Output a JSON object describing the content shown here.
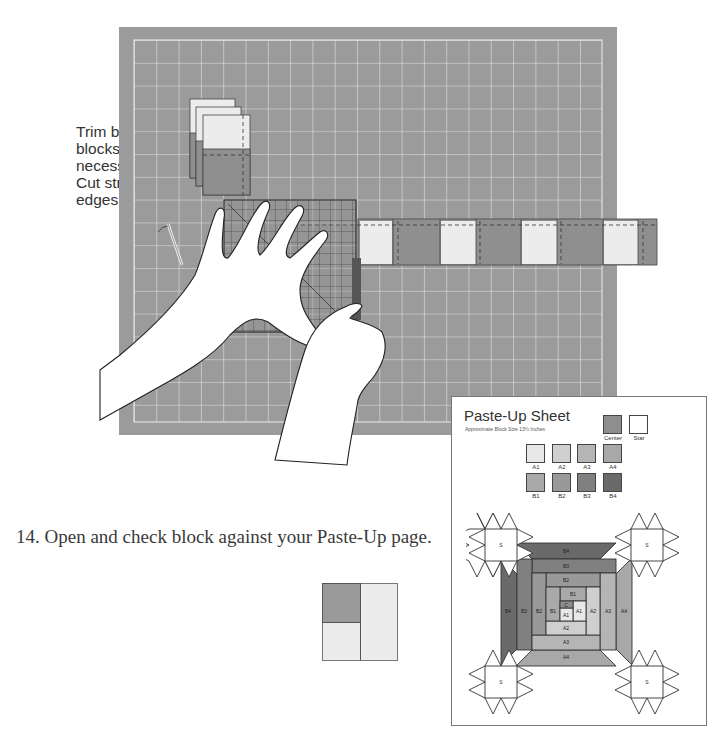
{
  "side_note": {
    "lines": [
      "Trim between",
      "blocks if",
      "necessary.",
      "Cut straight",
      "edges."
    ]
  },
  "step": {
    "text": "14. Open and check block against your Paste-Up page."
  },
  "illustration": {
    "description": "cutting-mat-with-ruler-and-hands",
    "mat_color": "#9b9b9b",
    "grid_color": "#e6e6e6",
    "light_fabric": "#e9e9e9",
    "dark_fabric": "#8f8f8f"
  },
  "block_preview": {
    "colors": {
      "dark": "#9a9a9a",
      "light": "#ececec"
    }
  },
  "paste_up_sheet": {
    "title": "Paste-Up Sheet",
    "subtitle": "Approximate Block Size 13½ Inches",
    "swatches": [
      {
        "label": "Center",
        "color": "#8e8e8e"
      },
      {
        "label": "Star",
        "color": "#ffffff"
      },
      {
        "label": "A1",
        "color": "#e8e8e8"
      },
      {
        "label": "A2",
        "color": "#cfcfcf"
      },
      {
        "label": "A3",
        "color": "#b5b5b5"
      },
      {
        "label": "A4",
        "color": "#a8a8a8"
      },
      {
        "label": "B1",
        "color": "#a9a9a9"
      },
      {
        "label": "B2",
        "color": "#999999"
      },
      {
        "label": "B3",
        "color": "#808080"
      },
      {
        "label": "B4",
        "color": "#6a6a6a"
      }
    ],
    "diagram_labels": {
      "star": "S",
      "center": "C",
      "a1": "A1",
      "a2": "A2",
      "a3": "A3",
      "a4": "A4",
      "b1": "B1",
      "b2": "B2",
      "b3": "B3",
      "b4": "B4"
    }
  }
}
